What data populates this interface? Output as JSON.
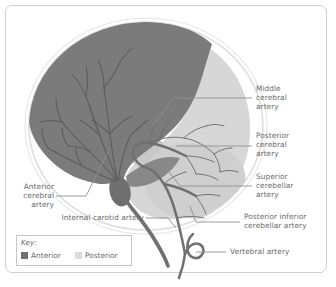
{
  "figure": {
    "type": "anatomical-diagram",
    "regions": [
      {
        "name": "Anterior circulation territory",
        "color": "#7b7b7b"
      },
      {
        "name": "Posterior circulation territory",
        "color": "#d7d7d7"
      },
      {
        "name": "Skull outline",
        "color": "#e2e2e2"
      }
    ]
  },
  "labels": {
    "middle_cerebral_artery": {
      "line1": "Middle",
      "line2": "cerebral",
      "line3": "artery"
    },
    "posterior_cerebral_artery": {
      "line1": "Posterior",
      "line2": "cerebral",
      "line3": "artery"
    },
    "superior_cerebellar_artery": {
      "line1": "Superior",
      "line2": "cerebellar",
      "line3": "artery"
    },
    "posterior_inferior_cerebellar_artery": {
      "line1": "Posterior inferior",
      "line2": "cerebellar artery"
    },
    "vertebral_artery": {
      "line1": "Vertebral artery"
    },
    "anterior_cerebral_artery": {
      "line1": "Anterior",
      "line2": "cerebral",
      "line3": "artery"
    },
    "internal_carotid_artery": {
      "line1": "Internal carotid artery"
    }
  },
  "key": {
    "title": "Key:",
    "items": [
      {
        "label": "Anterior",
        "color": "#6f6f6f"
      },
      {
        "label": "Posterior",
        "color": "#dcdcdc"
      }
    ]
  },
  "colors": {
    "anterior_fill": "#7b7b7b",
    "posterior_fill": "#d7d7d7",
    "cerebellum_fill": "#cfcfcf",
    "artery_stroke": "#707070",
    "vessel_thin": "#6a6a6a",
    "skull_outline": "#e4e4e4",
    "leader_line": "#8a8a8a",
    "text": "#6a6a6a",
    "frame_border": "#cfcfcf"
  }
}
